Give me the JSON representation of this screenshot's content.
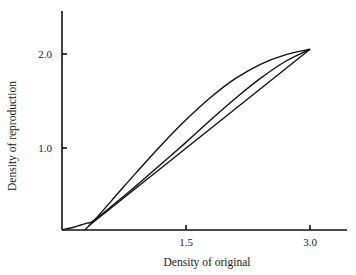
{
  "chart_data": {
    "type": "line",
    "title": "",
    "xlabel": "Density of original",
    "ylabel": "Density of reproduction",
    "x_ticks": [
      {
        "value": 1.5,
        "label": "1.5"
      },
      {
        "value": 3.0,
        "label": "3.0"
      }
    ],
    "y_ticks": [
      {
        "value": 1.0,
        "label": "1.0"
      },
      {
        "value": 2.0,
        "label": "2.0"
      }
    ],
    "xlim": [
      0,
      3.45
    ],
    "ylim": [
      0.13,
      2.45
    ],
    "grid": false,
    "legend": null,
    "series": [
      {
        "name": "S-shaped reproduction curve (upper)",
        "x": [
          0.28,
          0.4,
          0.6,
          0.9,
          1.2,
          1.5,
          1.8,
          2.1,
          2.4,
          2.7,
          3.0
        ],
        "y": [
          0.13,
          0.24,
          0.44,
          0.74,
          1.03,
          1.3,
          1.54,
          1.74,
          1.89,
          1.99,
          2.05
        ]
      },
      {
        "name": "Toe curve from origin (middle)",
        "x": [
          0.0,
          0.15,
          0.3,
          0.37,
          0.6,
          0.9,
          1.2,
          1.5,
          1.8,
          2.1,
          2.4,
          2.7,
          3.0
        ],
        "y": [
          0.13,
          0.16,
          0.2,
          0.22,
          0.38,
          0.6,
          0.83,
          1.06,
          1.3,
          1.53,
          1.74,
          1.92,
          2.05
        ]
      },
      {
        "name": "Straight-line reproduction (lower)",
        "x": [
          0.32,
          3.0
        ],
        "y": [
          0.17,
          2.05
        ]
      }
    ]
  },
  "figure": {
    "x_axis_label": "Density of original",
    "y_axis_label": "Density of reproduction",
    "x_tick_labels": [
      "1.5",
      "3.0"
    ],
    "y_tick_labels": [
      "1.0",
      "2.0"
    ]
  }
}
